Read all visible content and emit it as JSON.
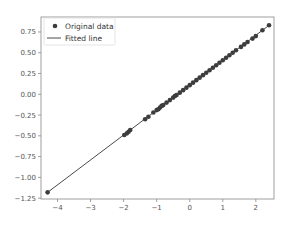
{
  "chart_data": {
    "type": "scatter",
    "title": "",
    "xlabel": "",
    "ylabel": "",
    "xlim": [
      -4.5,
      2.55
    ],
    "ylim": [
      -1.26,
      0.93
    ],
    "grid": false,
    "legend_position": "top-left",
    "x_ticks": [
      -4,
      -3,
      -2,
      -1,
      0,
      1,
      2
    ],
    "x_tick_labels": [
      "−4",
      "−3",
      "−2",
      "−1",
      "0",
      "1",
      "2"
    ],
    "y_ticks": [
      0.75,
      0.5,
      0.25,
      0.0,
      -0.25,
      -0.5,
      -0.75,
      -1.0,
      -1.25
    ],
    "y_tick_labels": [
      "0.75",
      "0.50",
      "0.25",
      "0.00",
      "−0.25",
      "−0.50",
      "−0.75",
      "−1.00",
      "−1.25"
    ],
    "colors": {
      "points": "#3d3d3d",
      "line": "#4a4a4a",
      "frame": "#888888"
    },
    "series": [
      {
        "name": "Original data",
        "kind": "scatter",
        "x": [
          -4.3,
          -1.98,
          -1.9,
          -1.85,
          -1.8,
          -1.35,
          -1.25,
          -1.1,
          -1.0,
          -0.95,
          -0.9,
          -0.85,
          -0.8,
          -0.7,
          -0.6,
          -0.5,
          -0.45,
          -0.4,
          -0.3,
          -0.2,
          -0.1,
          0.0,
          0.1,
          0.2,
          0.3,
          0.4,
          0.5,
          0.6,
          0.7,
          0.8,
          0.9,
          1.0,
          1.1,
          1.2,
          1.3,
          1.4,
          1.55,
          1.65,
          1.75,
          1.9,
          2.0,
          2.2,
          2.4
        ],
        "y": [
          -1.18,
          -0.49,
          -0.47,
          -0.45,
          -0.43,
          -0.3,
          -0.27,
          -0.22,
          -0.19,
          -0.18,
          -0.16,
          -0.14,
          -0.13,
          -0.1,
          -0.07,
          -0.04,
          -0.02,
          -0.01,
          0.02,
          0.05,
          0.08,
          0.11,
          0.14,
          0.17,
          0.2,
          0.23,
          0.26,
          0.29,
          0.32,
          0.35,
          0.38,
          0.41,
          0.44,
          0.47,
          0.5,
          0.53,
          0.57,
          0.6,
          0.63,
          0.67,
          0.7,
          0.77,
          0.83
        ]
      },
      {
        "name": "Fitted line",
        "kind": "line",
        "x": [
          -4.3,
          2.4
        ],
        "y": [
          -1.18,
          0.83
        ]
      }
    ]
  }
}
